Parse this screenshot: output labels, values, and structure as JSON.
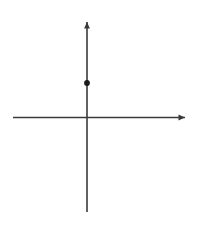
{
  "chart_data": {
    "type": "line",
    "title": "",
    "xlabel": "v",
    "ylabel": "T",
    "xlim": [
      -5,
      7.5
    ],
    "ylim": [
      -7.5,
      7
    ],
    "grid": true,
    "grid_step": 1,
    "legend": null,
    "xticks": [
      -4,
      -2,
      2,
      4,
      6
    ],
    "yticks": [
      6,
      4,
      2,
      -2,
      -4,
      -6
    ],
    "xtick_labels": [
      "–4",
      "–2",
      "2",
      "4",
      "6"
    ],
    "ytick_labels": [
      "6",
      "4",
      "2",
      "–2",
      "–4",
      "–6"
    ],
    "series": [
      {
        "name": "T(v)",
        "x": [
          0,
          1,
          3,
          4
        ],
        "values": [
          3,
          5,
          5,
          3
        ],
        "closed_endpoint": {
          "x": 0,
          "y": 3
        }
      }
    ],
    "annotations": []
  },
  "axes": {
    "y_axis_label": "T",
    "x_axis_label": "v"
  },
  "colors": {
    "grid": "#c9c9cf",
    "axis": "#3a3a3a",
    "curve": "#1a1a1a",
    "tick_text": "#2b2b2b",
    "background": "#ffffff"
  },
  "geometry": {
    "origin_x": 87,
    "origin_y": 117.5,
    "unit_px": 11.5,
    "grid_left": 13,
    "grid_right": 175,
    "grid_top": 33,
    "grid_bottom": 210
  }
}
